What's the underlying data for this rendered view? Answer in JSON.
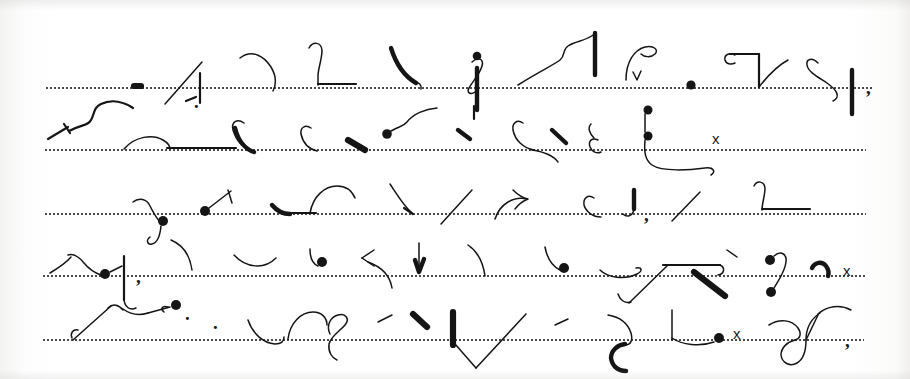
{
  "document": {
    "kind": "scanned-handwriting-page",
    "script": "shorthand",
    "page_width": 910,
    "page_height": 379,
    "background_color": "#fdfdfc",
    "ink_color": "#151515",
    "rule_color": "#3a3a3a"
  },
  "ruled_lines": [
    {
      "label": "line-1",
      "y": 88,
      "x": 45,
      "width": 828
    },
    {
      "label": "line-2",
      "y": 150,
      "x": 44,
      "width": 822
    },
    {
      "label": "line-3",
      "y": 214,
      "x": 44,
      "width": 822
    },
    {
      "label": "line-4",
      "y": 276,
      "x": 42,
      "width": 824
    },
    {
      "label": "line-5",
      "y": 340,
      "x": 42,
      "width": 822
    }
  ],
  "rows": [
    {
      "label": "row-1",
      "baseline_y": 88,
      "stroke_count": 11
    },
    {
      "label": "row-2",
      "baseline_y": 150,
      "stroke_count": 12
    },
    {
      "label": "row-3",
      "baseline_y": 214,
      "stroke_count": 11
    },
    {
      "label": "row-4",
      "baseline_y": 276,
      "stroke_count": 13
    },
    {
      "label": "row-5",
      "baseline_y": 340,
      "stroke_count": 12
    }
  ],
  "latin_marks": [
    {
      "label": "mark-x-row2",
      "text": "x",
      "x": 712,
      "y": 131
    },
    {
      "label": "mark-x-row4",
      "text": "x",
      "x": 843,
      "y": 263
    },
    {
      "label": "mark-x-row5",
      "text": "x",
      "x": 733,
      "y": 326
    },
    {
      "label": "mark-comma-row1",
      "text": ",",
      "x": 866,
      "y": 78
    },
    {
      "label": "mark-comma-row3a",
      "text": ",",
      "x": 136,
      "y": 267
    },
    {
      "label": "mark-comma-row3b",
      "text": ",",
      "x": 644,
      "y": 205
    },
    {
      "label": "mark-comma-row5",
      "text": ",",
      "x": 845,
      "y": 331
    },
    {
      "label": "mark-period-row1",
      "text": ".",
      "x": 194,
      "y": 92
    },
    {
      "label": "mark-period-row3",
      "text": ".",
      "x": 185,
      "y": 304
    },
    {
      "label": "mark-period-row4",
      "text": ".",
      "x": 213,
      "y": 313
    }
  ]
}
